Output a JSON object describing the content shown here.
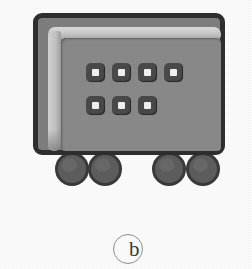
{
  "figure": {
    "label": "b",
    "label_shape": "circle",
    "background_color": "#fdfdfd"
  },
  "vehicle": {
    "body": {
      "name": "chassis-body",
      "border_color": "#2f2f2f",
      "fill_color": "#7f7f7f",
      "panel_color": "#8a8a8a",
      "highlight_color": "#d4d4d4"
    },
    "control_panel": {
      "name": "control-panel",
      "rows": [
        {
          "row_index": 0,
          "buttons": [
            {
              "id": "button-1",
              "indicator": "white-square"
            },
            {
              "id": "button-2",
              "indicator": "white-square"
            },
            {
              "id": "button-3",
              "indicator": "white-square"
            },
            {
              "id": "button-4",
              "indicator": "white-square"
            }
          ]
        },
        {
          "row_index": 1,
          "buttons": [
            {
              "id": "button-5",
              "indicator": "white-square"
            },
            {
              "id": "button-6",
              "indicator": "white-square"
            },
            {
              "id": "button-7",
              "indicator": "white-square"
            }
          ]
        }
      ],
      "button_color": "#4a4a4a",
      "indicator_color": "#f2f2f2",
      "total_buttons": 7
    },
    "wheels": [
      {
        "id": "wheel-front-left",
        "x": 55,
        "y": 152,
        "diameter": 34
      },
      {
        "id": "wheel-front-right",
        "x": 88,
        "y": 152,
        "diameter": 34
      },
      {
        "id": "wheel-rear-left",
        "x": 152,
        "y": 152,
        "diameter": 34
      },
      {
        "id": "wheel-rear-right",
        "x": 186,
        "y": 152,
        "diameter": 34
      }
    ],
    "wheel_count": 4,
    "wheel_fill": "#5e5e5e",
    "wheel_border": "#3a3a3a"
  }
}
